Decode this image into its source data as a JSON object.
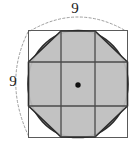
{
  "figure": {
    "labels": {
      "top_side": "9",
      "left_side": "9"
    },
    "colors": {
      "fill": "#c2c2c2",
      "stroke": "#3a3a3a",
      "square_stroke": "#555555",
      "grid_stroke": "#4a4a4a",
      "dashed_stroke": "#9a9a9a",
      "center_dot": "#111111",
      "background": "#ffffff"
    },
    "geometry": {
      "square": {
        "x": 28,
        "y": 30,
        "side": 100
      },
      "circle": {
        "cx": 78,
        "cy": 80,
        "r": 50
      },
      "center_dot": {
        "cx": 78,
        "cy": 85,
        "r": 2.6
      },
      "grid_lines": {
        "vertical_x": [
          61,
          95
        ],
        "horizontal_y": [
          62,
          106
        ]
      },
      "octagon_points": "61,30 95,30 128,62 128,106 95,138 61,138 28,106 28,62",
      "dim_arc_top": "M 30,30 Q 78,4 126,30",
      "dim_arc_left": "M 28,32 Q 4,80 28,136"
    }
  }
}
